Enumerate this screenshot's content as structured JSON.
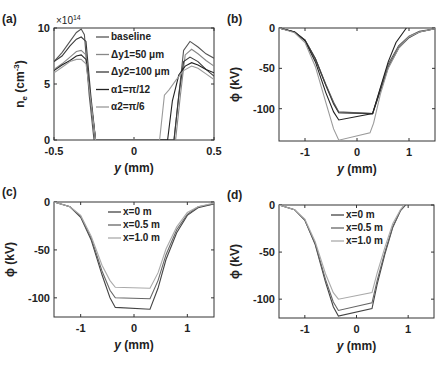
{
  "chart_data": [
    {
      "panel": "(a)",
      "type": "line",
      "xlabel": "y (mm)",
      "ylabel": "n_e (cm^-3)",
      "y_multiplier": "×10^14",
      "xlim": [
        -0.5,
        0.5
      ],
      "ylim": [
        0,
        10
      ],
      "xticks": [
        "-0.5",
        "0",
        "0.5"
      ],
      "yticks": [
        "0",
        "5",
        "10"
      ],
      "legend": [
        "baseline",
        "Δy1=50 μm",
        "Δy2=100 μm",
        "α1=π/12",
        "α2=π/6"
      ],
      "series": [
        {
          "name": "baseline",
          "color": "#555555",
          "x": [
            -0.5,
            -0.45,
            -0.4,
            -0.36,
            -0.33,
            -0.31,
            -0.28,
            -0.25,
            0.25,
            0.28,
            0.31,
            0.35,
            0.4,
            0.45,
            0.5
          ],
          "y": [
            7.0,
            7.8,
            8.8,
            9.6,
            9.9,
            9.4,
            4,
            0,
            0,
            4,
            8.0,
            8.8,
            8.3,
            7.7,
            7.3
          ]
        },
        {
          "name": "Δy1=50 μm",
          "color": "#888888",
          "x": [
            -0.5,
            -0.45,
            -0.4,
            -0.36,
            -0.33,
            -0.3,
            -0.27,
            -0.24,
            0.26,
            0.29,
            0.32,
            0.36,
            0.4,
            0.45,
            0.5
          ],
          "y": [
            6.3,
            6.8,
            7.4,
            7.9,
            8.0,
            7.6,
            3.5,
            0,
            0,
            4,
            7.6,
            8.1,
            7.7,
            7.1,
            6.6
          ]
        },
        {
          "name": "Δy2=100 μm",
          "color": "#3a3a3a",
          "x": [
            -0.5,
            -0.45,
            -0.4,
            -0.36,
            -0.33,
            -0.3,
            -0.27,
            -0.24,
            0.25,
            0.28,
            0.31,
            0.35,
            0.4,
            0.45,
            0.5
          ],
          "y": [
            7.0,
            7.5,
            8.4,
            9.0,
            9.2,
            8.8,
            4,
            0,
            0,
            4,
            7.0,
            7.4,
            7.0,
            6.3,
            5.7
          ]
        },
        {
          "name": "α1=π/12",
          "color": "#222222",
          "x": [
            -0.5,
            -0.45,
            -0.4,
            -0.36,
            -0.33,
            -0.3,
            -0.27,
            -0.24,
            0.21,
            0.24,
            0.28,
            0.32,
            0.36,
            0.4,
            0.45,
            0.5
          ],
          "y": [
            6.2,
            6.7,
            7.1,
            7.5,
            7.6,
            7.2,
            3.5,
            0,
            0,
            3.5,
            5.8,
            6.6,
            6.9,
            6.7,
            6.3,
            6.0
          ]
        },
        {
          "name": "α2=π/6",
          "color": "#9a9a9a",
          "x": [
            -0.5,
            -0.45,
            -0.4,
            -0.36,
            -0.33,
            -0.3,
            -0.27,
            -0.24,
            0.16,
            0.19,
            0.22,
            0.26,
            0.31,
            0.36,
            0.4,
            0.45,
            0.5
          ],
          "y": [
            6.0,
            6.5,
            7.0,
            7.2,
            7.2,
            6.8,
            3.5,
            0,
            0,
            4.0,
            4.5,
            5.3,
            6.2,
            6.6,
            6.4,
            5.9,
            5.4
          ]
        }
      ]
    },
    {
      "panel": "(b)",
      "type": "line",
      "xlabel": "y (mm)",
      "ylabel": "φ (kV)",
      "xlim": [
        -1.5,
        1.5
      ],
      "ylim": [
        -140,
        0
      ],
      "xticks": [
        "-1",
        "0",
        "1"
      ],
      "yticks": [
        "0",
        "-50",
        "-100"
      ],
      "series": [
        {
          "name": "baseline",
          "color": "#555555",
          "x": [
            -1.5,
            -1.2,
            -1.0,
            -0.8,
            -0.6,
            -0.45,
            -0.35,
            0.3,
            0.45,
            0.6,
            0.8,
            1.0,
            1.2,
            1.5
          ],
          "y": [
            0,
            -5,
            -15,
            -38,
            -70,
            -92,
            -104,
            -106,
            -75,
            -45,
            -22,
            -10,
            -4,
            -1
          ]
        },
        {
          "name": "Δy1=50 μm",
          "color": "#888888",
          "x": [
            -1.5,
            -1.2,
            -1.0,
            -0.8,
            -0.6,
            -0.45,
            -0.35,
            0.3,
            0.45,
            0.6,
            0.8,
            1.0,
            1.2,
            1.5
          ],
          "y": [
            0,
            -5,
            -15,
            -38,
            -70,
            -93,
            -105,
            -106,
            -76,
            -47,
            -24,
            -11,
            -5,
            -1
          ]
        },
        {
          "name": "Δy2=100 μm",
          "color": "#3a3a3a",
          "x": [
            -1.5,
            -1.2,
            -1.0,
            -0.8,
            -0.6,
            -0.45,
            -0.35,
            0.3,
            0.45,
            0.6,
            0.8,
            1.0,
            1.2,
            1.5
          ],
          "y": [
            0,
            -5,
            -15,
            -38,
            -71,
            -94,
            -105,
            -106,
            -78,
            -49,
            -25,
            -12,
            -5,
            -1
          ]
        },
        {
          "name": "α1=π/12",
          "color": "#222222",
          "x": [
            -1.5,
            -1.2,
            -1.0,
            -0.8,
            -0.6,
            -0.45,
            -0.35,
            0.3,
            0.45,
            0.6,
            0.75,
            0.95
          ],
          "y": [
            0,
            -5,
            -16,
            -42,
            -80,
            -104,
            -114,
            -106,
            -74,
            -42,
            -18,
            0
          ]
        },
        {
          "name": "α2=π/6",
          "color": "#9a9a9a",
          "x": [
            -1.5,
            -1.2,
            -1.0,
            -0.8,
            -0.6,
            -0.45,
            -0.35,
            0.25,
            0.32,
            0.45,
            0.6,
            0.8,
            1.0,
            1.2,
            1.5
          ],
          "y": [
            0,
            -6,
            -18,
            -48,
            -92,
            -125,
            -139,
            -130,
            -118,
            -82,
            -50,
            -25,
            -11,
            -5,
            -1
          ]
        }
      ]
    },
    {
      "panel": "(c)",
      "type": "line",
      "xlabel": "y (mm)",
      "ylabel": "φ (kV)",
      "xlim": [
        -1.5,
        1.5
      ],
      "ylim": [
        -120,
        0
      ],
      "xticks": [
        "-1",
        "0",
        "1"
      ],
      "yticks": [
        "0",
        "-50",
        "-100"
      ],
      "legend": [
        "x=0 m",
        "x=0.5 m",
        "x=1.0 m"
      ],
      "series": [
        {
          "name": "x=0 m",
          "color": "#444444",
          "x": [
            -1.5,
            -1.2,
            -1.0,
            -0.8,
            -0.6,
            -0.45,
            -0.35,
            0.3,
            0.45,
            0.6,
            0.8,
            1.0,
            1.2,
            1.5
          ],
          "y": [
            0,
            -5,
            -16,
            -40,
            -76,
            -100,
            -110,
            -112,
            -90,
            -60,
            -32,
            -14,
            -6,
            -2
          ]
        },
        {
          "name": "x=0.5 m",
          "color": "#666666",
          "x": [
            -1.5,
            -1.2,
            -1.0,
            -0.8,
            -0.6,
            -0.45,
            -0.35,
            0.3,
            0.45,
            0.6,
            0.8,
            1.0,
            1.2,
            1.5
          ],
          "y": [
            0,
            -5,
            -15,
            -38,
            -72,
            -92,
            -100,
            -101,
            -82,
            -55,
            -29,
            -13,
            -5,
            -2
          ]
        },
        {
          "name": "x=1.0 m",
          "color": "#aaaaaa",
          "x": [
            -1.5,
            -1.2,
            -1.0,
            -0.8,
            -0.6,
            -0.45,
            -0.35,
            0.3,
            0.45,
            0.6,
            0.8,
            1.0,
            1.2,
            1.5
          ],
          "y": [
            0,
            -5,
            -14,
            -36,
            -66,
            -82,
            -89,
            -90,
            -74,
            -49,
            -26,
            -11,
            -5,
            -1
          ]
        }
      ]
    },
    {
      "panel": "(d)",
      "type": "line",
      "xlabel": "y (mm)",
      "ylabel": "φ (kV)",
      "xlim": [
        -1.5,
        1.5
      ],
      "ylim": [
        -120,
        0
      ],
      "xticks": [
        "-1",
        "0",
        "1"
      ],
      "yticks": [
        "0",
        "-50",
        "-100"
      ],
      "legend": [
        "x=0 m",
        "x=0.5 m",
        "x=1.0 m"
      ],
      "series": [
        {
          "name": "x=0 m",
          "color": "#444444",
          "x": [
            -1.5,
            -1.2,
            -1.0,
            -0.8,
            -0.6,
            -0.45,
            -0.35,
            0.3,
            0.4,
            0.55,
            0.7,
            0.85,
            0.95
          ],
          "y": [
            0,
            -5,
            -16,
            -42,
            -82,
            -108,
            -118,
            -110,
            -84,
            -52,
            -24,
            -6,
            0
          ]
        },
        {
          "name": "x=0.5 m",
          "color": "#666666",
          "x": [
            -1.5,
            -1.2,
            -1.0,
            -0.8,
            -0.6,
            -0.45,
            -0.35,
            0.3,
            0.4,
            0.55,
            0.7,
            0.85,
            0.95
          ],
          "y": [
            0,
            -5,
            -16,
            -41,
            -79,
            -103,
            -112,
            -104,
            -80,
            -50,
            -23,
            -6,
            0
          ]
        },
        {
          "name": "x=1.0 m",
          "color": "#aaaaaa",
          "x": [
            -1.5,
            -1.2,
            -1.0,
            -0.8,
            -0.6,
            -0.45,
            -0.35,
            0.3,
            0.4,
            0.55,
            0.7,
            0.85,
            0.92
          ],
          "y": [
            0,
            -5,
            -15,
            -39,
            -73,
            -93,
            -100,
            -93,
            -72,
            -45,
            -20,
            -5,
            0
          ]
        }
      ]
    }
  ],
  "panels": {
    "a": {
      "label": "(a)",
      "ylabel_main": "n",
      "ylabel_sub": "e",
      "ylabel_unit": " (cm",
      "ylabel_exp": "-3",
      "ylabel_close": ")",
      "multiplier": "×10",
      "multiplier_exp": "14",
      "xlabel_var": "y",
      "xlabel_unit": " (mm)"
    },
    "b": {
      "label": "(b)",
      "ylabel": "ϕ (kV)",
      "xlabel_var": "y",
      "xlabel_unit": " (mm)"
    },
    "c": {
      "label": "(c)",
      "ylabel": "ϕ (kV)",
      "xlabel_var": "y",
      "xlabel_unit": " (mm)"
    },
    "d": {
      "label": "(d)",
      "ylabel": "ϕ (kV)",
      "xlabel_var": "y",
      "xlabel_unit": " (mm)"
    }
  }
}
